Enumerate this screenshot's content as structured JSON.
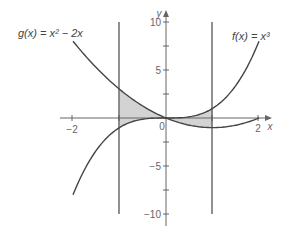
{
  "chart_data": {
    "type": "line",
    "title": "",
    "xlabel": "x",
    "ylabel": "y",
    "xlim": [
      -2.2,
      2.3
    ],
    "ylim": [
      -11,
      11
    ],
    "grid": false,
    "x_ticks": [
      -2,
      -1,
      0,
      1,
      2
    ],
    "x_tick_labels": [
      "-2",
      "",
      "0",
      "",
      "2"
    ],
    "y_ticks": [
      -10,
      -7.5,
      -5,
      -2.5,
      0,
      2.5,
      5,
      7.5,
      10
    ],
    "y_tick_labels": [
      "-10",
      "",
      "-5",
      "",
      "",
      "",
      "5",
      "",
      "10"
    ],
    "series": [
      {
        "name": "f(x) = x³",
        "expression": "x^3",
        "x": [
          -2,
          -1.5,
          -1,
          -0.5,
          0,
          0.5,
          1,
          1.5,
          2
        ],
        "values": [
          -8,
          -3.375,
          -1,
          -0.125,
          0,
          0.125,
          1,
          3.375,
          8
        ]
      },
      {
        "name": "g(x) = x² − 2x",
        "expression": "x^2 - 2x",
        "x": [
          -2,
          -1.5,
          -1,
          -0.5,
          0,
          0.5,
          1,
          1.5,
          2
        ],
        "values": [
          8,
          5.25,
          3,
          1.25,
          0,
          -0.75,
          -1,
          -0.75,
          0
        ]
      }
    ],
    "vertical_lines": [
      -1,
      1
    ],
    "shaded_region": {
      "between": [
        "f",
        "g"
      ],
      "x_range": [
        -1,
        1
      ],
      "color": "#d3d3d3"
    },
    "annotations": [
      {
        "text": "g(x) = x² − 2x",
        "position": "top-left"
      },
      {
        "text": "f(x) = x³",
        "position": "top-right"
      }
    ]
  },
  "labels": {
    "g_label": "g(x) = x² − 2x",
    "f_label": "f(x) = x³",
    "x_axis": "x",
    "y_axis": "y",
    "tick_neg2": "−2",
    "tick_0": "0",
    "tick_2": "2",
    "tick_10": "10",
    "tick_5": "5",
    "tick_neg5": "−5",
    "tick_neg10": "−10"
  },
  "colors": {
    "curve": "#444444",
    "axis": "#666666",
    "shade": "#d3d3d3"
  }
}
